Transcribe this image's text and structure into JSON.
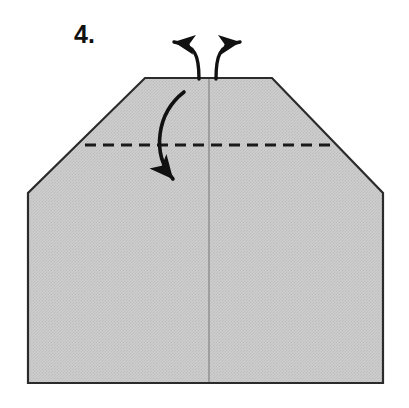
{
  "figure": {
    "kind": "origami-fold-diagram",
    "step_label": "4.",
    "background_color": "#ffffff",
    "paper": {
      "name": "folded-paper-shape",
      "fill_color": "#c9c9c9",
      "stroke_color": "#2b2b2b",
      "stroke_width": 2.2,
      "outline_points": "145,78 272,78 383,193 383,383 28,383 28,193",
      "description": "Pentagon-like house shape with clipped upper-left and upper-right corners"
    },
    "center_crease": {
      "name": "vertical-center-crease",
      "color": "#9a9a9a",
      "x": 209,
      "y_top": 78,
      "y_bottom": 383
    },
    "fold_line": {
      "name": "horizontal-fold-crease",
      "style": "dashed",
      "color": "#1a1a1a",
      "stroke_width": 3,
      "dash": "11 7",
      "x_start": 85,
      "x_end": 334,
      "y": 145
    },
    "arrows": [
      {
        "name": "arrow-top-left-outward",
        "color": "#111111",
        "direction": "up-left",
        "path": "M 199,79 C 199,56 196,45 172,42",
        "tip": "158,42",
        "stroke_width": 3.4
      },
      {
        "name": "arrow-top-right-outward",
        "color": "#111111",
        "direction": "up-right",
        "path": "M 216,79 C 216,56 219,45 240,42",
        "tip": "252,41",
        "stroke_width": 3.4
      },
      {
        "name": "arrow-fold-down",
        "color": "#111111",
        "direction": "down-right",
        "path": "M 184,92 C 158,112 152,152 172,178",
        "tip": "188,191",
        "stroke_width": 3.6
      }
    ]
  }
}
